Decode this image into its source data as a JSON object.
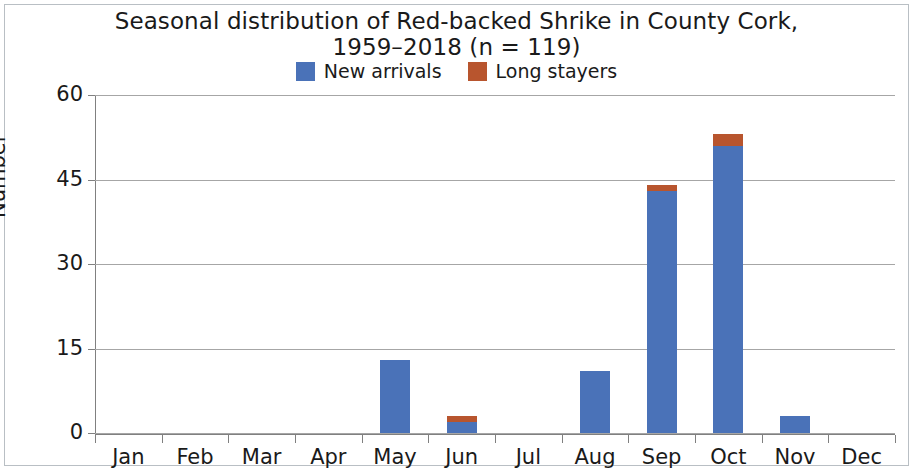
{
  "chart_data": {
    "type": "bar",
    "title": "Seasonal distribution of Red-backed Shrike in County Cork, 1959–2018 (n = 119)",
    "title_lines": [
      "Seasonal distribution of Red-backed Shrike in County Cork,",
      "1959–2018 (n = 119)"
    ],
    "xlabel": "",
    "ylabel": "Number",
    "ylim": [
      0,
      60
    ],
    "yticks": [
      0,
      15,
      30,
      45,
      60
    ],
    "ytick_labels": [
      "0",
      "15",
      "30",
      "45",
      "60"
    ],
    "grid": true,
    "stacked": true,
    "legend_position": "top-center",
    "categories": [
      "Jan",
      "Feb",
      "Mar",
      "Apr",
      "May",
      "Jun",
      "Jul",
      "Aug",
      "Sep",
      "Oct",
      "Nov",
      "Dec"
    ],
    "series": [
      {
        "name": "New arrivals",
        "color": "#4A72B8",
        "values": [
          0,
          0,
          0,
          0,
          13,
          2,
          0,
          11,
          43,
          51,
          3,
          0
        ]
      },
      {
        "name": "Long stayers",
        "color": "#B8552E",
        "values": [
          0,
          0,
          0,
          0,
          0,
          1,
          0,
          0,
          1,
          2,
          0,
          0
        ]
      }
    ]
  },
  "legend": {
    "items": [
      {
        "label": "New arrivals",
        "color": "#4A72B8"
      },
      {
        "label": "Long stayers",
        "color": "#B8552E"
      }
    ]
  }
}
